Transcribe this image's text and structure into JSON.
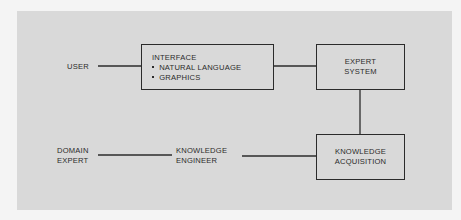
{
  "diagram": {
    "background_color": "#d9d9d9",
    "ink_color": "#2b2b2b",
    "nodes": {
      "user": {
        "label": "USER"
      },
      "interface": {
        "title": "INTERFACE",
        "items": [
          "NATURAL LANGUAGE",
          "GRAPHICS"
        ]
      },
      "expert_system": {
        "line1": "EXPERT",
        "line2": "SYSTEM"
      },
      "knowledge_acquisition": {
        "line1": "KNOWLEDGE",
        "line2": "ACQUISITION"
      },
      "knowledge_engineer": {
        "line1": "KNOWLEDGE",
        "line2": "ENGINEER"
      },
      "domain_expert": {
        "line1": "DOMAIN",
        "line2": "EXPERT"
      }
    },
    "edges": [
      {
        "from": "user",
        "to": "interface"
      },
      {
        "from": "interface",
        "to": "expert_system"
      },
      {
        "from": "expert_system",
        "to": "knowledge_acquisition"
      },
      {
        "from": "knowledge_engineer",
        "to": "knowledge_acquisition"
      },
      {
        "from": "domain_expert",
        "to": "knowledge_engineer"
      }
    ]
  }
}
